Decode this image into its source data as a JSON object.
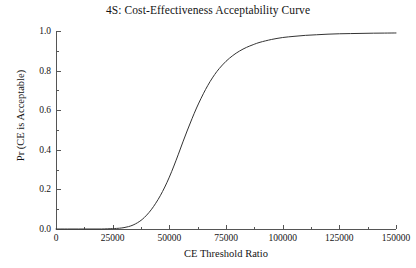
{
  "chart_data": {
    "type": "line",
    "title": "4S: Cost-Effectiveness Acceptability Curve",
    "xlabel": "CE Threshold Ratio",
    "ylabel": "Pr (CE is Acceptable)",
    "xlim": [
      0,
      150000
    ],
    "ylim": [
      0.0,
      1.0
    ],
    "grid": false,
    "legend": null,
    "x_ticks": [
      0,
      25000,
      50000,
      75000,
      100000,
      125000,
      150000
    ],
    "x_tick_labels": [
      "0",
      "25000",
      "50000",
      "75000",
      "100000",
      "125000",
      "150000"
    ],
    "x_minor_tick_count": 1,
    "y_ticks": [
      0.0,
      0.2,
      0.4,
      0.6,
      0.8,
      1.0
    ],
    "y_tick_labels": [
      "0.0",
      "0.2",
      "0.4",
      "0.6",
      "0.8",
      "1.0"
    ],
    "y_minor_tick_count": 1,
    "series": [
      {
        "name": "CEAC",
        "color": "#333333",
        "line_width": 1,
        "x": [
          0,
          5000,
          10000,
          15000,
          20000,
          25000,
          28000,
          30000,
          32000,
          34000,
          36000,
          38000,
          40000,
          42000,
          44000,
          46000,
          48000,
          50000,
          52000,
          54000,
          56000,
          58000,
          60000,
          62000,
          64000,
          66000,
          68000,
          70000,
          72000,
          75000,
          78000,
          81000,
          84000,
          87000,
          90000,
          95000,
          100000,
          105000,
          110000,
          115000,
          120000,
          125000,
          130000,
          135000,
          140000,
          145000,
          150000
        ],
        "y": [
          0.0,
          0.0,
          0.0,
          0.0,
          0.0,
          0.002,
          0.004,
          0.007,
          0.012,
          0.02,
          0.032,
          0.048,
          0.07,
          0.097,
          0.13,
          0.168,
          0.212,
          0.262,
          0.318,
          0.378,
          0.44,
          0.5,
          0.557,
          0.611,
          0.66,
          0.705,
          0.745,
          0.78,
          0.81,
          0.847,
          0.876,
          0.899,
          0.917,
          0.931,
          0.943,
          0.957,
          0.967,
          0.973,
          0.978,
          0.981,
          0.984,
          0.986,
          0.987,
          0.988,
          0.989,
          0.9895,
          0.99
        ]
      }
    ]
  },
  "axes": {
    "axis_color": "#555555",
    "tick_length_major": 4,
    "tick_length_minor": 2
  }
}
